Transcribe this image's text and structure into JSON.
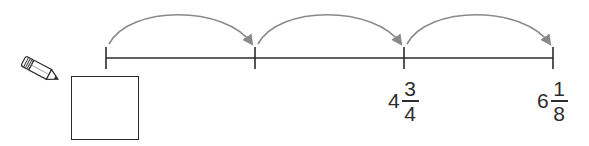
{
  "diagram": {
    "type": "number-line-with-equal-jumps",
    "colors": {
      "line": "#2b2b2b",
      "arc": "#8a8a8a",
      "text": "#2e2e2e",
      "background": "#ffffff"
    },
    "ticks": [
      {
        "index": 0,
        "x": 106,
        "label": null
      },
      {
        "index": 1,
        "x": 255,
        "label": null
      },
      {
        "index": 2,
        "x": 404,
        "label": {
          "whole": "4",
          "numerator": "3",
          "denominator": "4"
        }
      },
      {
        "index": 3,
        "x": 553,
        "label": {
          "whole": "6",
          "numerator": "1",
          "denominator": "8"
        }
      }
    ],
    "jumps": [
      {
        "from": 0,
        "to": 1
      },
      {
        "from": 1,
        "to": 2
      },
      {
        "from": 2,
        "to": 3
      }
    ],
    "answer_box": {
      "value": ""
    },
    "pencil_icon": "pencil-icon"
  }
}
